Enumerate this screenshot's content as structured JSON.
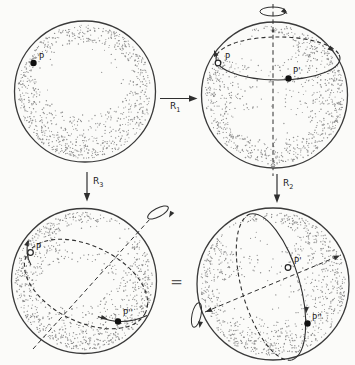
{
  "figure_labels": {
    "equals_sign": "=",
    "arrow_r1": {
      "letter": "R",
      "subscript": "1"
    },
    "arrow_r2": {
      "letter": "R",
      "subscript": "2"
    },
    "arrow_r3": {
      "letter": "R",
      "subscript": "3"
    }
  },
  "spheres": {
    "top_left": {
      "labels": {
        "p": "P"
      }
    },
    "top_right": {
      "labels": {
        "p": "P",
        "p_prime": "P'"
      }
    },
    "bottom_left": {
      "labels": {
        "p": "P",
        "p_double_prime": "P''"
      }
    },
    "bottom_right": {
      "labels": {
        "p_prime": "P'",
        "p_double_prime": "P''"
      }
    }
  },
  "colors": {
    "line": "#2f2f2f",
    "stipple": "#8f8f8f",
    "background": "#fbfbf9",
    "point": "#111111"
  }
}
